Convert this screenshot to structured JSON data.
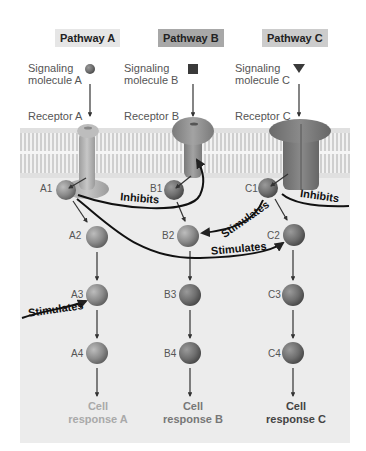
{
  "pathways": [
    {
      "id": "A",
      "title": "Pathway A",
      "title_bg": "#e6e6e6",
      "signal_label_1": "Signaling",
      "signal_label_2": "molecule A",
      "signal_shape": "circle",
      "receptor_label": "Receptor A",
      "nodes": [
        "A1",
        "A2",
        "A3",
        "A4"
      ],
      "response_1": "Cell",
      "response_2": "response A",
      "response_color": "#a9a9a9"
    },
    {
      "id": "B",
      "title": "Pathway B",
      "title_bg": "#a8a8a8",
      "signal_label_1": "Signaling",
      "signal_label_2": "molecule B",
      "signal_shape": "square",
      "receptor_label": "Receptor B",
      "nodes": [
        "B1",
        "B2",
        "B3",
        "B4"
      ],
      "response_1": "Cell",
      "response_2": "response B",
      "response_color": "#777777"
    },
    {
      "id": "C",
      "title": "Pathway C",
      "title_bg": "#cccccc",
      "signal_label_1": "Signaling",
      "signal_label_2": "molecule C",
      "signal_shape": "triangle",
      "receptor_label": "Receptor C",
      "nodes": [
        "C1",
        "C2",
        "C3",
        "C4"
      ],
      "response_1": "Cell",
      "response_2": "response C",
      "response_color": "#444444"
    }
  ],
  "interactions": [
    {
      "from": "A1",
      "to": "B1",
      "label": "Inhibits"
    },
    {
      "from": "A1",
      "to": "C2",
      "label": "Stimulates"
    },
    {
      "from": "C1",
      "to": "B2",
      "label": "Stimulates"
    },
    {
      "from": "C1",
      "to": "offscreen-right",
      "label": "Inhibits"
    },
    {
      "from": "offscreen-left",
      "to": "A3",
      "label": "Stimulates"
    }
  ],
  "colors": {
    "cytoplasm": "#ececec",
    "membrane": "#d6d6d6",
    "protein": "#8c8c8c",
    "arrow": "#111111"
  }
}
